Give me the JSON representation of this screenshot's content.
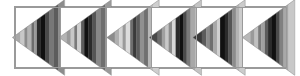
{
  "figure": {
    "kind": "filmstrip-sequence",
    "frame_count": 6,
    "background_color": "#ffffff",
    "border_color": "#9a9a9a",
    "strip": {
      "x": 14,
      "y": 6,
      "width": 274,
      "height": 63
    }
  },
  "palette": {
    "white": "#ffffff",
    "very_light_gray": "#e0e0e0",
    "light_gray": "#c8c8c8",
    "mid_light_gray": "#a8a8a8",
    "mid_gray": "#8c8c8c",
    "mid_dark_gray": "#6e6e6e",
    "dark_gray": "#4a4a4a",
    "very_dark_gray": "#2b2b2b",
    "black": "#111111",
    "border": "#9a9a9a"
  },
  "frames": [
    {
      "index": 1,
      "label": "frame-1",
      "apex_x": -0.06,
      "tip_direction": "left",
      "stripes": [
        {
          "offset": 0.0,
          "width": 0.155,
          "color": "#a8a8a8"
        },
        {
          "offset": 0.155,
          "width": 0.075,
          "color": "#c8c8c8"
        },
        {
          "offset": 0.23,
          "width": 0.06,
          "color": "#8c8c8c"
        },
        {
          "offset": 0.29,
          "width": 0.075,
          "color": "#b4b4b4"
        },
        {
          "offset": 0.365,
          "width": 0.055,
          "color": "#6e6e6e"
        },
        {
          "offset": 0.42,
          "width": 0.05,
          "color": "#9a9a9a"
        },
        {
          "offset": 0.47,
          "width": 0.07,
          "color": "#2b2b2b"
        },
        {
          "offset": 0.54,
          "width": 0.085,
          "color": "#111111"
        },
        {
          "offset": 0.625,
          "width": 0.075,
          "color": "#4a4a4a"
        },
        {
          "offset": 0.7,
          "width": 0.085,
          "color": "#777777"
        },
        {
          "offset": 0.785,
          "width": 0.095,
          "color": "#5c5c5c"
        },
        {
          "offset": 0.88,
          "width": 0.12,
          "color": "#8c8c8c"
        }
      ]
    },
    {
      "index": 2,
      "label": "frame-2",
      "apex_x": -0.02,
      "tip_direction": "left",
      "stripes": [
        {
          "offset": 0.0,
          "width": 0.14,
          "color": "#b4b4b4"
        },
        {
          "offset": 0.14,
          "width": 0.08,
          "color": "#9a9a9a"
        },
        {
          "offset": 0.22,
          "width": 0.07,
          "color": "#c8c8c8"
        },
        {
          "offset": 0.29,
          "width": 0.055,
          "color": "#7a7a7a"
        },
        {
          "offset": 0.345,
          "width": 0.075,
          "color": "#d0d0d0"
        },
        {
          "offset": 0.42,
          "width": 0.06,
          "color": "#5c5c5c"
        },
        {
          "offset": 0.48,
          "width": 0.08,
          "color": "#111111"
        },
        {
          "offset": 0.56,
          "width": 0.07,
          "color": "#2b2b2b"
        },
        {
          "offset": 0.63,
          "width": 0.075,
          "color": "#555555"
        },
        {
          "offset": 0.705,
          "width": 0.085,
          "color": "#888888"
        },
        {
          "offset": 0.79,
          "width": 0.09,
          "color": "#6e6e6e"
        },
        {
          "offset": 0.88,
          "width": 0.12,
          "color": "#9a9a9a"
        }
      ]
    },
    {
      "index": 3,
      "label": "frame-3",
      "apex_x": 0.02,
      "tip_direction": "left",
      "stripes": [
        {
          "offset": 0.0,
          "width": 0.15,
          "color": "#8c8c8c"
        },
        {
          "offset": 0.15,
          "width": 0.085,
          "color": "#b0b0b0"
        },
        {
          "offset": 0.235,
          "width": 0.065,
          "color": "#d4d4d4"
        },
        {
          "offset": 0.3,
          "width": 0.06,
          "color": "#9a9a9a"
        },
        {
          "offset": 0.36,
          "width": 0.085,
          "color": "#dcdcdc"
        },
        {
          "offset": 0.445,
          "width": 0.055,
          "color": "#6e6e6e"
        },
        {
          "offset": 0.5,
          "width": 0.06,
          "color": "#3a3a3a"
        },
        {
          "offset": 0.56,
          "width": 0.07,
          "color": "#5c5c5c"
        },
        {
          "offset": 0.63,
          "width": 0.08,
          "color": "#909090"
        },
        {
          "offset": 0.71,
          "width": 0.075,
          "color": "#707070"
        },
        {
          "offset": 0.785,
          "width": 0.095,
          "color": "#b8b8b8"
        },
        {
          "offset": 0.88,
          "width": 0.12,
          "color": "#cfcfcf"
        }
      ]
    },
    {
      "index": 4,
      "label": "frame-4",
      "apex_x": -0.04,
      "tip_direction": "left",
      "stripes": [
        {
          "offset": 0.0,
          "width": 0.16,
          "color": "#4a4a4a"
        },
        {
          "offset": 0.16,
          "width": 0.08,
          "color": "#6e6e6e"
        },
        {
          "offset": 0.24,
          "width": 0.07,
          "color": "#a0a0a0"
        },
        {
          "offset": 0.31,
          "width": 0.06,
          "color": "#c8c8c8"
        },
        {
          "offset": 0.37,
          "width": 0.065,
          "color": "#8c8c8c"
        },
        {
          "offset": 0.435,
          "width": 0.07,
          "color": "#d8d8d8"
        },
        {
          "offset": 0.505,
          "width": 0.075,
          "color": "#2b2b2b"
        },
        {
          "offset": 0.58,
          "width": 0.065,
          "color": "#111111"
        },
        {
          "offset": 0.645,
          "width": 0.07,
          "color": "#4a4a4a"
        },
        {
          "offset": 0.715,
          "width": 0.075,
          "color": "#7a7a7a"
        },
        {
          "offset": 0.79,
          "width": 0.09,
          "color": "#a8a8a8"
        },
        {
          "offset": 0.88,
          "width": 0.12,
          "color": "#c4c4c4"
        }
      ]
    },
    {
      "index": 5,
      "label": "frame-5",
      "apex_x": -0.07,
      "tip_direction": "left",
      "stripes": [
        {
          "offset": 0.0,
          "width": 0.17,
          "color": "#3a3a3a"
        },
        {
          "offset": 0.17,
          "width": 0.085,
          "color": "#5c5c5c"
        },
        {
          "offset": 0.255,
          "width": 0.07,
          "color": "#8c8c8c"
        },
        {
          "offset": 0.325,
          "width": 0.065,
          "color": "#6e6e6e"
        },
        {
          "offset": 0.39,
          "width": 0.07,
          "color": "#a8a8a8"
        },
        {
          "offset": 0.46,
          "width": 0.06,
          "color": "#d0d0d0"
        },
        {
          "offset": 0.52,
          "width": 0.09,
          "color": "#111111"
        },
        {
          "offset": 0.61,
          "width": 0.07,
          "color": "#2b2b2b"
        },
        {
          "offset": 0.68,
          "width": 0.07,
          "color": "#555555"
        },
        {
          "offset": 0.75,
          "width": 0.07,
          "color": "#8c8c8c"
        },
        {
          "offset": 0.82,
          "width": 0.07,
          "color": "#b4b4b4"
        },
        {
          "offset": 0.89,
          "width": 0.11,
          "color": "#cccccc"
        }
      ]
    },
    {
      "index": 6,
      "label": "frame-6",
      "apex_x": 0.01,
      "tip_direction": "left",
      "stripes": [
        {
          "offset": 0.0,
          "width": 0.15,
          "color": "#b8b8b8"
        },
        {
          "offset": 0.15,
          "width": 0.08,
          "color": "#9a9a9a"
        },
        {
          "offset": 0.23,
          "width": 0.07,
          "color": "#c0c0c0"
        },
        {
          "offset": 0.3,
          "width": 0.06,
          "color": "#7a7a7a"
        },
        {
          "offset": 0.36,
          "width": 0.07,
          "color": "#a0a0a0"
        },
        {
          "offset": 0.43,
          "width": 0.06,
          "color": "#5c5c5c"
        },
        {
          "offset": 0.49,
          "width": 0.075,
          "color": "#2b2b2b"
        },
        {
          "offset": 0.565,
          "width": 0.075,
          "color": "#111111"
        },
        {
          "offset": 0.64,
          "width": 0.07,
          "color": "#4a4a4a"
        },
        {
          "offset": 0.71,
          "width": 0.075,
          "color": "#808080"
        },
        {
          "offset": 0.785,
          "width": 0.095,
          "color": "#a8a8a8"
        },
        {
          "offset": 0.88,
          "width": 0.12,
          "color": "#c8c8c8"
        }
      ]
    }
  ]
}
